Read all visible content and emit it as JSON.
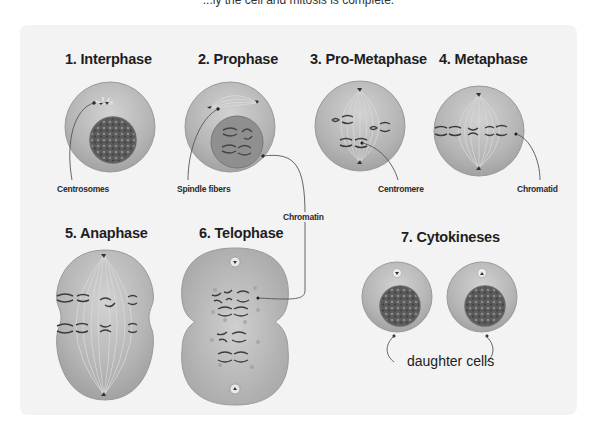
{
  "caption": "...ly the cell and mitosis is complete.",
  "colors": {
    "panel_bg": "#f3f3f3",
    "cell_fill": "#b9b9b9",
    "cell_edge": "#8f8f8f",
    "nucleus_fill": "#6a6a6a",
    "chromosome": "#3a3a3a",
    "spindle": "#d4d4d4",
    "pointer_line": "#555555"
  },
  "stages": [
    {
      "number": "1",
      "title": "1. Interphase"
    },
    {
      "number": "2",
      "title": "2. Prophase"
    },
    {
      "number": "3",
      "title": "3. Pro-Metaphase"
    },
    {
      "number": "4",
      "title": "4. Metaphase"
    },
    {
      "number": "5",
      "title": "5. Anaphase"
    },
    {
      "number": "6",
      "title": "6. Telophase"
    },
    {
      "number": "7",
      "title": "7. Cytokineses"
    }
  ],
  "labels": {
    "centrosomes": "Centrosomes",
    "spindle_fibers": "Spindle fibers",
    "centromere": "Centromere",
    "chromatid": "Chromatid",
    "chromatin": "Chromatin",
    "daughter_cells": "daughter cells"
  }
}
